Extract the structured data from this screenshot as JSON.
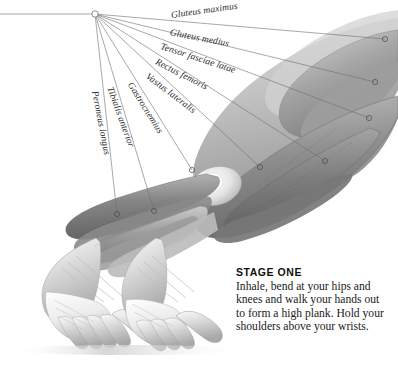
{
  "figure": {
    "kind": "anatomical-illustration",
    "background_color": "#ffffff",
    "leader_hub": {
      "x": 95,
      "y": 14
    },
    "leader_line_color": "#6e6e6e",
    "labels": [
      {
        "id": "gluteus-maximus",
        "text": "Gluteus maximus",
        "x": 171,
        "y": 10,
        "rotate": -8,
        "target_x": 385,
        "target_y": 39
      },
      {
        "id": "gluteus-medius",
        "text": "Gluteus medius",
        "x": 170,
        "y": 27,
        "rotate": 11,
        "target_x": 375,
        "target_y": 82
      },
      {
        "id": "tensor-fasciae-latae",
        "text": "Tensor fasciae latae",
        "x": 161,
        "y": 41,
        "rotate": 18,
        "target_x": 369,
        "target_y": 118
      },
      {
        "id": "rectus-femoris",
        "text": "Rectus femoris",
        "x": 156,
        "y": 56,
        "rotate": 27,
        "target_x": 325,
        "target_y": 161
      },
      {
        "id": "vastus-lateralis",
        "text": "Vastus lateralis",
        "x": 147,
        "y": 70,
        "rotate": 37,
        "target_x": 260,
        "target_y": 167
      },
      {
        "id": "gastrocnemius",
        "text": "Gastrocnemius",
        "x": 130,
        "y": 78,
        "rotate": 58,
        "target_x": 192,
        "target_y": 170
      },
      {
        "id": "tibialis-anterior",
        "text": "Tibialis anterior",
        "x": 110,
        "y": 82,
        "rotate": 70,
        "target_x": 154,
        "target_y": 211
      },
      {
        "id": "peroneus-longus",
        "text": "Peroneus longus",
        "x": 95,
        "y": 86,
        "rotate": 79,
        "target_x": 117,
        "target_y": 214
      }
    ]
  },
  "caption": {
    "title": "STAGE ONE",
    "body": "Inhale, bend at your hips and knees and walk your hands out to form a high plank. Hold your shoulders above your wrists."
  },
  "palette": {
    "muscle_dark": "#6b6b6b",
    "muscle_mid": "#8e8e8e",
    "muscle_light": "#b4b4b4",
    "skin_pale": "#d9d9d9",
    "bone_white": "#f2f2f2",
    "outline": "#5a5a5a",
    "text_dark": "#1a1a1a"
  }
}
